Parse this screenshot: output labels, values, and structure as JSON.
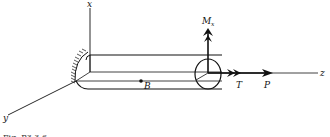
{
  "diagram": {
    "axes": {
      "x": "x",
      "y": "y",
      "z": "z"
    },
    "point_label": "B",
    "moment_label": "M",
    "moment_subscript": "x",
    "torque_label": "T",
    "force_label": "P",
    "caption": "Fig. P3.3.6",
    "colors": {
      "ink": "#111111",
      "background": "#ffffff"
    }
  }
}
